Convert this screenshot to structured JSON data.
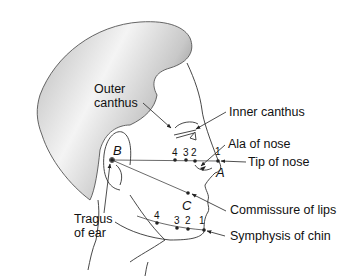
{
  "figure": {
    "type": "anatomical-diagram",
    "labels": {
      "outer_canthus": [
        "Outer",
        "canthus"
      ],
      "inner_canthus": "Inner canthus",
      "ala_of_nose": "Ala of nose",
      "tip_of_nose": "Tip of nose",
      "commissure_of_lips": "Commissure of lips",
      "symphysis_of_chin": "Symphysis of chin",
      "tragus_of_ear": [
        "Tragus",
        "of ear"
      ]
    },
    "points": {
      "A": "A",
      "B": "B",
      "C": "C"
    },
    "upper_line_markers": [
      "4",
      "3",
      "2",
      "1"
    ],
    "lower_line_markers": [
      "4",
      "3",
      "2",
      "1"
    ],
    "colors": {
      "hair_light": "#f2f2f2",
      "hair_dark": "#8a8a8a",
      "line": "#333333",
      "text": "#111111"
    }
  }
}
